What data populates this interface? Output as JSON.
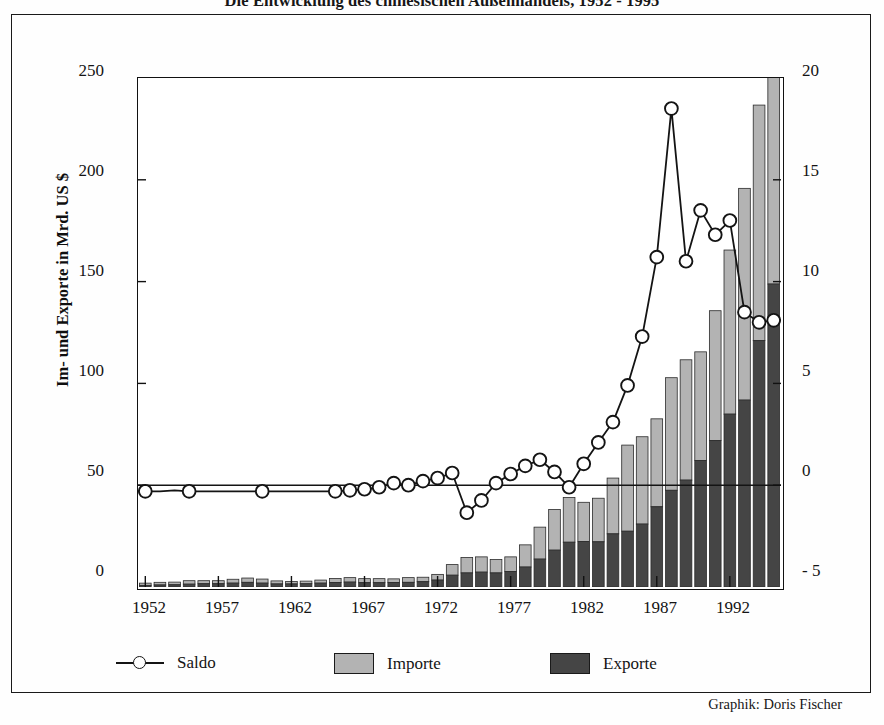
{
  "title": "Die Entwicklung des chinesischen Außenhandels, 1952 - 1995",
  "credit": "Graphik: Doris Fischer",
  "axes": {
    "ylabel_left": "Im- und Exporte in Mrd. US $",
    "yticks_left": [
      "0",
      "50",
      "100",
      "150",
      "200",
      "250"
    ],
    "yticks_right": [
      "- 5",
      "0",
      "5",
      "10",
      "15",
      "20"
    ],
    "xticks": [
      "1952",
      "1957",
      "1962",
      "1967",
      "1972",
      "1977",
      "1982",
      "1987",
      "1992"
    ]
  },
  "legend": {
    "saldo": "Saldo",
    "importe": "Importe",
    "exporte": "Exporte"
  },
  "colors": {
    "importe": "#b3b3b3",
    "exporte": "#454545",
    "line": "#141414",
    "frame": "#1a1a1a",
    "background": "#ffffff"
  },
  "chart_data": {
    "type": "bar",
    "title": "Die Entwicklung des chinesischen Außenhandels, 1952 - 1995",
    "xlabel": "",
    "ylabel": "Im- und Exporte in Mrd. US $",
    "ylabel_secondary": "Saldo in Mrd. US $",
    "ylim": [
      0,
      250
    ],
    "ylim_secondary": [
      -5,
      20
    ],
    "grid": false,
    "legend_position": "bottom",
    "stacked": true,
    "categories": [
      "1952",
      "1953",
      "1954",
      "1955",
      "1956",
      "1957",
      "1958",
      "1959",
      "1960",
      "1961",
      "1962",
      "1963",
      "1964",
      "1965",
      "1966",
      "1967",
      "1968",
      "1969",
      "1970",
      "1971",
      "1972",
      "1973",
      "1974",
      "1975",
      "1976",
      "1977",
      "1978",
      "1979",
      "1980",
      "1981",
      "1982",
      "1983",
      "1984",
      "1985",
      "1986",
      "1987",
      "1988",
      "1989",
      "1990",
      "1991",
      "1992",
      "1993",
      "1994",
      "1995"
    ],
    "series": [
      {
        "name": "Exporte",
        "axis": "left",
        "color": "#454545",
        "values": [
          0.8,
          1.0,
          1.1,
          1.4,
          1.6,
          1.6,
          1.9,
          2.3,
          1.9,
          1.5,
          1.5,
          1.6,
          1.9,
          2.2,
          2.4,
          2.1,
          2.1,
          2.2,
          2.3,
          2.6,
          3.4,
          5.8,
          6.9,
          7.3,
          6.9,
          7.6,
          9.8,
          13.7,
          18.1,
          22.0,
          22.3,
          22.2,
          26.1,
          27.4,
          30.9,
          39.4,
          47.5,
          52.5,
          62.1,
          71.9,
          84.9,
          91.8,
          121.0,
          148.8
        ]
      },
      {
        "name": "Importe",
        "axis": "left",
        "color": "#b3b3b3",
        "values": [
          1.1,
          1.3,
          1.3,
          1.7,
          1.5,
          1.5,
          1.9,
          2.1,
          2.0,
          1.5,
          1.2,
          1.3,
          1.5,
          2.0,
          2.2,
          2.0,
          2.0,
          1.8,
          2.3,
          2.2,
          2.8,
          5.2,
          7.6,
          7.5,
          6.6,
          7.2,
          10.9,
          15.7,
          20.0,
          22.0,
          19.3,
          21.4,
          27.4,
          42.3,
          42.9,
          43.2,
          55.3,
          59.1,
          53.4,
          63.8,
          80.6,
          104.0,
          115.7,
          132.1
        ]
      },
      {
        "name": "Saldo",
        "axis": "right",
        "color": "#141414",
        "values": [
          -0.3,
          -0.3,
          -0.2,
          -0.3,
          0.1,
          0.1,
          0.0,
          0.2,
          -0.1,
          0.0,
          0.3,
          0.3,
          0.4,
          0.2,
          0.2,
          0.1,
          0.1,
          0.4,
          0.0,
          0.4,
          0.6,
          0.6,
          -0.7,
          -0.2,
          0.3,
          0.4,
          -1.1,
          -2.0,
          -1.9,
          0.0,
          3.0,
          0.8,
          -1.3,
          -14.9,
          -12.0,
          -3.8,
          -7.8,
          -6.6,
          8.7,
          8.1,
          4.4,
          -12.2,
          5.3,
          16.7
        ],
        "note": "Plotted curve shown in the figure (right axis, Mrd. US $)",
        "plotted": [
          -0.3,
          -0.3,
          -0.25,
          -0.3,
          -0.3,
          -0.3,
          -0.3,
          -0.3,
          -0.3,
          -0.3,
          -0.3,
          -0.3,
          -0.3,
          -0.3,
          -0.25,
          -0.2,
          -0.1,
          0.1,
          0.0,
          0.2,
          0.35,
          0.6,
          -1.35,
          -0.75,
          0.1,
          0.55,
          0.95,
          1.25,
          0.65,
          -0.1,
          1.05,
          2.1,
          3.1,
          4.9,
          7.3,
          11.2,
          18.5,
          11.0,
          13.5,
          12.3,
          13.0,
          8.5,
          8.0,
          8.1
        ]
      }
    ]
  }
}
